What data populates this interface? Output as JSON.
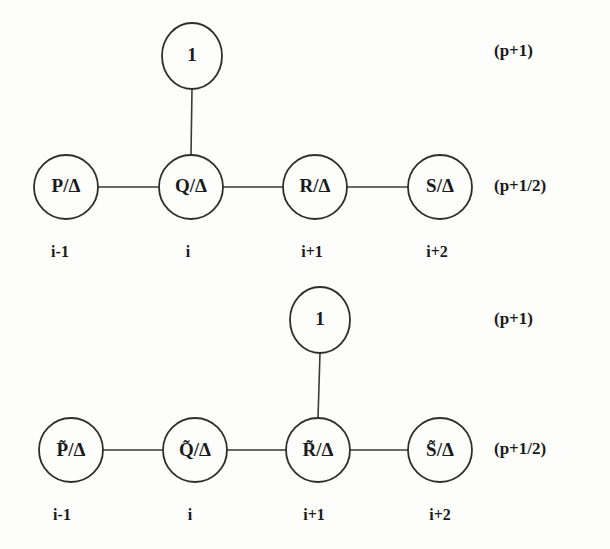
{
  "figure": {
    "background_color": "#fdfdfc",
    "ink_color": "#2e2e2e"
  },
  "diagrams": [
    {
      "id": "upper-stencil",
      "apex_node": {
        "label": "1",
        "cx": 192,
        "cy": 56,
        "rx": 30,
        "ry": 33
      },
      "apex_attached_to": "Q",
      "row_nodes": [
        {
          "id": "P",
          "label": "P/Δ",
          "cx": 66,
          "cy": 187,
          "rx": 32,
          "ry": 32
        },
        {
          "id": "Q",
          "label": "Q/Δ",
          "cx": 191,
          "cy": 187,
          "rx": 32,
          "ry": 32
        },
        {
          "id": "R",
          "label": "R/Δ",
          "cx": 315,
          "cy": 187,
          "rx": 32,
          "ry": 32
        },
        {
          "id": "S",
          "label": "S/Δ",
          "cx": 440,
          "cy": 187,
          "rx": 32,
          "ry": 32
        }
      ],
      "index_labels": [
        {
          "text": "i-1",
          "x": 60,
          "y": 253
        },
        {
          "text": "i",
          "x": 188,
          "y": 253
        },
        {
          "text": "i+1",
          "x": 312,
          "y": 253
        },
        {
          "text": "i+2",
          "x": 437,
          "y": 253
        }
      ],
      "level_labels": [
        {
          "text": "(p+1)",
          "x": 494,
          "y": 52
        },
        {
          "text": "(p+1/2)",
          "x": 494,
          "y": 187
        }
      ]
    },
    {
      "id": "lower-stencil",
      "apex_node": {
        "label": "1",
        "cx": 320,
        "cy": 320,
        "rx": 30,
        "ry": 33
      },
      "apex_attached_to": "Rt",
      "row_nodes": [
        {
          "id": "Pt",
          "label": "P̃/Δ",
          "cx": 71,
          "cy": 450,
          "rx": 32,
          "ry": 32
        },
        {
          "id": "Qt",
          "label": "Q̃/Δ",
          "cx": 195,
          "cy": 450,
          "rx": 32,
          "ry": 32
        },
        {
          "id": "Rt",
          "label": "R̃/Δ",
          "cx": 318,
          "cy": 450,
          "rx": 32,
          "ry": 32
        },
        {
          "id": "St",
          "label": "S̃/Δ",
          "cx": 440,
          "cy": 450,
          "rx": 32,
          "ry": 32
        }
      ],
      "index_labels": [
        {
          "text": "i-1",
          "x": 62,
          "y": 516
        },
        {
          "text": "i",
          "x": 190,
          "y": 516
        },
        {
          "text": "i+1",
          "x": 314,
          "y": 516
        },
        {
          "text": "i+2",
          "x": 440,
          "y": 516
        }
      ],
      "level_labels": [
        {
          "text": "(p+1)",
          "x": 494,
          "y": 320
        },
        {
          "text": "(p+1/2)",
          "x": 494,
          "y": 450
        }
      ]
    }
  ]
}
